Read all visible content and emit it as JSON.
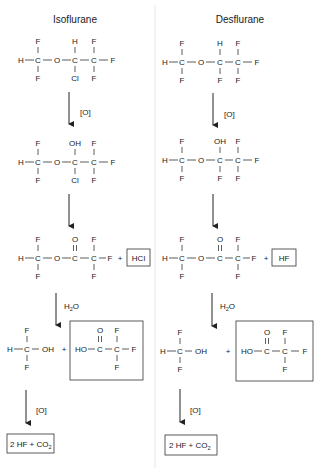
{
  "columns": [
    {
      "title": "Isoflurane",
      "step1": {
        "top": [
          "F",
          "H",
          "F"
        ],
        "bottom": [
          "F",
          "Cl",
          "F"
        ],
        "left": "H",
        "right": "F",
        "ether": "O",
        "carbon": "C"
      },
      "arrow1_label": "[O]",
      "step2": {
        "top": [
          "F",
          "OH",
          "F"
        ],
        "bottom": [
          "F",
          "Cl",
          "F"
        ],
        "left": "H",
        "right": "F",
        "ether": "O",
        "carbon": "C"
      },
      "step3": {
        "top": [
          "F",
          "O",
          "F"
        ],
        "bottom": [
          "F",
          "F"
        ],
        "left": "H",
        "right": "F",
        "ether": "O",
        "carbon": "C",
        "plus": "+",
        "byproduct": "HCl"
      },
      "arrow3_label_main": "H",
      "arrow3_label_sub": "2",
      "arrow3_label_end": "O",
      "step4": {
        "methanol": {
          "top": "F",
          "bottom": "F",
          "left": "H",
          "carbon": "C",
          "oh": "OH"
        },
        "plus": "+",
        "acid": {
          "ho": "HO",
          "carbonyl_o": "O",
          "top": "F",
          "bottom": "F",
          "right": "F",
          "carbon": "C"
        }
      },
      "arrow4_label": "[O]",
      "final": {
        "main": "2 HF + CO",
        "sub": "2"
      }
    },
    {
      "title": "Desflurane",
      "step1": {
        "top": [
          "F",
          "H",
          "F"
        ],
        "bottom": [
          "F",
          "F",
          "F"
        ],
        "left": "H",
        "right": "F",
        "ether": "O",
        "carbon": "C"
      },
      "arrow1_label": "[O]",
      "step2": {
        "top": [
          "F",
          "OH",
          "F"
        ],
        "bottom": [
          "F",
          "F",
          "F"
        ],
        "left": "H",
        "right": "F",
        "ether": "O",
        "carbon": "C"
      },
      "step3": {
        "top": [
          "F",
          "O",
          "F"
        ],
        "bottom": [
          "F",
          "F"
        ],
        "left": "H",
        "right": "F",
        "ether": "O",
        "carbon": "C",
        "plus": "+",
        "byproduct": "HF"
      },
      "arrow3_label_main": "H",
      "arrow3_label_sub": "2",
      "arrow3_label_end": "O",
      "step4": {
        "methanol": {
          "top": "F",
          "bottom": "F",
          "left": "H",
          "carbon": "C",
          "oh": "OH"
        },
        "plus": "+",
        "acid": {
          "ho": "HO",
          "carbonyl_o": "O",
          "top": "F",
          "bottom": "F",
          "right": "F",
          "carbon": "C"
        }
      },
      "arrow4_label": "[O]",
      "final": {
        "main": "2 HF + CO",
        "sub": "2"
      }
    }
  ]
}
